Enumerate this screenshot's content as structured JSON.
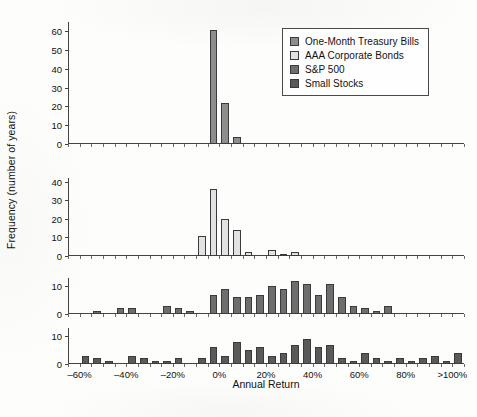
{
  "figure": {
    "xlabel": "Annual Return",
    "ylabel": "Frequency (number of years)",
    "background_color": "#fdfdfc"
  },
  "legend": {
    "position": "top-right",
    "entries": [
      {
        "label": "One-Month Treasury Bills",
        "color": "#8d8d8d",
        "swatch_name": "legend-swatch-tbills"
      },
      {
        "label": "AAA Corporate Bonds",
        "color": "#e2e2e2",
        "swatch_name": "legend-swatch-aaa"
      },
      {
        "label": "S&P 500",
        "color": "#6e6e6e",
        "swatch_name": "legend-swatch-sp500"
      },
      {
        "label": "Small Stocks",
        "color": "#5a5a5a",
        "swatch_name": "legend-swatch-small"
      }
    ]
  },
  "axis": {
    "x_tick_labels": [
      "–60%",
      "–40%",
      "–20%",
      "0%",
      "20%",
      "40%",
      "60%",
      "80%",
      ">100%"
    ],
    "x_tick_values": [
      -60,
      -40,
      -20,
      0,
      20,
      40,
      60,
      80,
      100
    ],
    "x_min": -65,
    "x_max": 105,
    "bin_width": 5
  },
  "chart_data": {
    "type": "bar",
    "title": "",
    "xlabel": "Annual Return",
    "ylabel": "Frequency (number of years)",
    "grid": false,
    "legend_position": "top-right",
    "bin_width": 5,
    "bin_centers": [
      -62.5,
      -57.5,
      -52.5,
      -47.5,
      -42.5,
      -37.5,
      -32.5,
      -27.5,
      -22.5,
      -17.5,
      -12.5,
      -7.5,
      -2.5,
      2.5,
      7.5,
      12.5,
      17.5,
      22.5,
      27.5,
      32.5,
      37.5,
      42.5,
      47.5,
      52.5,
      57.5,
      62.5,
      67.5,
      72.5,
      77.5,
      82.5,
      87.5,
      92.5,
      97.5,
      102.5
    ],
    "panels": [
      {
        "name": "One-Month Treasury Bills",
        "color": "#8d8d8d",
        "ylim": [
          0,
          65
        ],
        "yticks": [
          0,
          10,
          20,
          30,
          40,
          50,
          60
        ],
        "values": [
          0,
          0,
          0,
          0,
          0,
          0,
          0,
          0,
          0,
          0,
          0,
          0,
          61,
          22,
          4,
          0,
          0,
          0,
          0,
          0,
          0,
          0,
          0,
          0,
          0,
          0,
          0,
          0,
          0,
          0,
          0,
          0,
          0,
          0
        ]
      },
      {
        "name": "AAA Corporate Bonds",
        "color": "#e2e2e2",
        "ylim": [
          0,
          42
        ],
        "yticks": [
          0,
          10,
          20,
          30,
          40
        ],
        "values": [
          0,
          0,
          0,
          0,
          0,
          0,
          0,
          0,
          0,
          0,
          0,
          11,
          36,
          20,
          14,
          2,
          0,
          3,
          1,
          2,
          0,
          0,
          0,
          0,
          0,
          0,
          0,
          0,
          0,
          0,
          0,
          0,
          0,
          0
        ]
      },
      {
        "name": "S&P 500",
        "color": "#6e6e6e",
        "ylim": [
          0,
          13
        ],
        "yticks": [
          0,
          10
        ],
        "values": [
          0,
          0,
          1,
          0,
          2,
          2,
          0,
          0,
          3,
          2,
          1,
          0,
          7,
          9,
          6,
          6,
          7,
          10,
          9,
          12,
          11,
          7,
          11,
          6,
          3,
          2,
          1,
          3,
          0,
          0,
          0,
          0,
          0,
          0
        ]
      },
      {
        "name": "Small Stocks",
        "color": "#5a5a5a",
        "ylim": [
          0,
          13
        ],
        "yticks": [
          0,
          10
        ],
        "values": [
          0,
          3,
          2,
          1,
          0,
          3,
          2,
          1,
          1,
          2,
          0,
          2,
          6,
          3,
          8,
          5,
          6,
          3,
          4,
          7,
          9,
          6,
          7,
          2,
          1,
          4,
          2,
          1,
          2,
          1,
          2,
          3,
          1,
          4
        ]
      }
    ]
  }
}
